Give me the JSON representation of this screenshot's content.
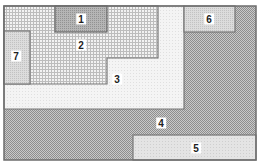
{
  "diagram": {
    "type": "region-map",
    "regions": [
      {
        "id": "1",
        "label": "1",
        "pattern": "dark-stipple",
        "x": 55,
        "y": 6,
        "w": 52,
        "h": 26,
        "label_pos": [
          81,
          19
        ]
      },
      {
        "id": "2",
        "label": "2",
        "pattern": "grid",
        "label_pos": [
          81,
          45
        ]
      },
      {
        "id": "3",
        "label": "3",
        "pattern": "light-stipple",
        "label_pos": [
          117,
          79
        ]
      },
      {
        "id": "4",
        "label": "4",
        "pattern": "checker",
        "label_pos": [
          161,
          123
        ]
      },
      {
        "id": "5",
        "label": "5",
        "pattern": "light-dots",
        "x": 133,
        "y": 135,
        "w": 123,
        "h": 25,
        "label_pos": [
          196,
          148
        ]
      },
      {
        "id": "6",
        "label": "6",
        "pattern": "medium-stipple",
        "x": 184,
        "y": 6,
        "w": 51,
        "h": 26,
        "label_pos": [
          209,
          19
        ]
      },
      {
        "id": "7",
        "label": "7",
        "pattern": "medium-stipple",
        "x": 4,
        "y": 31,
        "w": 26,
        "h": 53,
        "label_pos": [
          16,
          56
        ]
      }
    ],
    "colors": {
      "border": "#6e6e6e",
      "dark": "#9a9a9a",
      "grid": "#b4b4b4",
      "light": "#ebebeb"
    }
  }
}
